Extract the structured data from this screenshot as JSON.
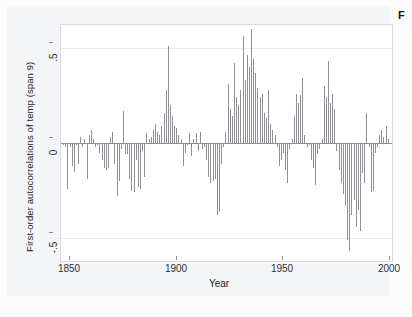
{
  "figure": {
    "corner_tag": "F",
    "background_color": "#fbfbfc",
    "panel_color": "#ffffff",
    "bar_color": "#8f9094",
    "axis_color": "#8e8e92",
    "grid_color": "#e9eaec"
  },
  "chart_data": {
    "type": "bar",
    "title": "",
    "subtitle": "",
    "xlabel": "Year",
    "ylabel": "First-order autocorrelations of temp (span 9)",
    "xlim": [
      1843,
      1998
    ],
    "ylim": [
      -0.62,
      0.62
    ],
    "xticks": [
      1850,
      1900,
      1950,
      2000
    ],
    "xtick_labels": [
      "1850",
      "1900",
      "1950",
      "2000"
    ],
    "yticks": [
      0.5,
      0,
      -0.5
    ],
    "ytick_labels": [
      ".5",
      "0",
      "-.5"
    ],
    "grid": true,
    "grid_axis": "y",
    "legend": "none",
    "zero_reference_line": 0,
    "x": [
      1844,
      1845,
      1846,
      1847,
      1848,
      1849,
      1850,
      1851,
      1852,
      1853,
      1854,
      1855,
      1856,
      1857,
      1858,
      1859,
      1860,
      1861,
      1862,
      1863,
      1864,
      1865,
      1866,
      1867,
      1868,
      1869,
      1870,
      1871,
      1872,
      1873,
      1874,
      1875,
      1876,
      1877,
      1878,
      1879,
      1880,
      1881,
      1882,
      1883,
      1884,
      1885,
      1886,
      1887,
      1888,
      1889,
      1890,
      1891,
      1892,
      1893,
      1894,
      1895,
      1896,
      1897,
      1898,
      1899,
      1900,
      1901,
      1902,
      1903,
      1904,
      1905,
      1906,
      1907,
      1908,
      1909,
      1910,
      1911,
      1912,
      1913,
      1914,
      1915,
      1916,
      1917,
      1918,
      1919,
      1920,
      1921,
      1922,
      1923,
      1924,
      1925,
      1926,
      1927,
      1928,
      1929,
      1930,
      1931,
      1932,
      1933,
      1934,
      1935,
      1936,
      1937,
      1938,
      1939,
      1940,
      1941,
      1942,
      1943,
      1944,
      1945,
      1946,
      1947,
      1948,
      1949,
      1950,
      1951,
      1952,
      1953,
      1954,
      1955,
      1956,
      1957,
      1958,
      1959,
      1960,
      1961,
      1962,
      1963,
      1964,
      1965,
      1966,
      1967,
      1968,
      1969,
      1970,
      1971,
      1972,
      1973,
      1974,
      1975,
      1976,
      1977,
      1978,
      1979,
      1980,
      1981,
      1982,
      1983,
      1984,
      1985,
      1986,
      1987,
      1988,
      1989,
      1990,
      1991,
      1992,
      1993,
      1994,
      1995,
      1996
    ],
    "values": [
      -0.01,
      -0.02,
      -0.24,
      -0.02,
      -0.12,
      -0.15,
      -0.01,
      -0.11,
      0.03,
      -0.02,
      0.02,
      -0.19,
      0.04,
      0.07,
      0.02,
      -0.02,
      -0.01,
      -0.05,
      -0.09,
      -0.13,
      -0.14,
      -0.13,
      0.03,
      0.06,
      -0.11,
      -0.28,
      -0.2,
      -0.03,
      0.17,
      -0.06,
      -0.06,
      -0.19,
      -0.25,
      -0.26,
      -0.09,
      -0.23,
      -0.24,
      -0.04,
      -0.18,
      0.05,
      0.02,
      0.03,
      0.07,
      0.1,
      0.06,
      0.04,
      0.09,
      0.16,
      0.28,
      0.51,
      0.2,
      0.14,
      0.09,
      0.08,
      0.04,
      0.02,
      -0.12,
      -0.05,
      -0.01,
      0.05,
      -0.07,
      0.02,
      0.05,
      -0.04,
      0.06,
      -0.03,
      -0.02,
      -0.09,
      -0.18,
      -0.21,
      -0.2,
      -0.19,
      -0.38,
      -0.36,
      -0.11,
      -0.02,
      0.06,
      0.31,
      0.18,
      0.14,
      0.42,
      0.24,
      0.2,
      0.28,
      0.56,
      0.33,
      0.46,
      0.4,
      0.6,
      0.44,
      0.37,
      0.29,
      0.24,
      0.26,
      0.16,
      0.13,
      0.28,
      0.1,
      0.07,
      0.04,
      -0.02,
      -0.12,
      -0.09,
      -0.05,
      -0.14,
      -0.21,
      -0.03,
      0.02,
      0.14,
      0.26,
      0.21,
      0.25,
      0.34,
      0.04,
      -0.02,
      -0.01,
      -0.09,
      -0.13,
      -0.22,
      -0.06,
      -0.03,
      0.02,
      0.3,
      0.24,
      0.43,
      0.21,
      0.26,
      0.18,
      -0.04,
      -0.14,
      -0.21,
      -0.27,
      -0.33,
      -0.51,
      -0.57,
      -0.38,
      -0.3,
      -0.44,
      -0.35,
      -0.46,
      -0.16,
      -0.21,
      0.16,
      -0.02,
      -0.26,
      -0.25,
      -0.05,
      -0.02,
      0.04,
      0.07,
      0.03,
      0.09,
      0.02
    ]
  }
}
